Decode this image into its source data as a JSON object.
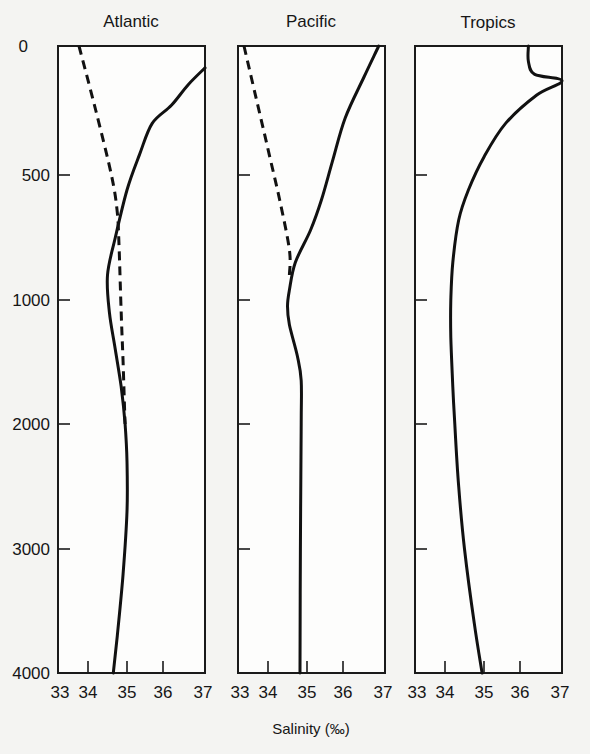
{
  "chart_data": {
    "type": "line",
    "title": "",
    "xlabel": "Salinity (‰)",
    "ylabel": "Depth (m)",
    "y_ticks": [
      0,
      500,
      1000,
      2000,
      3000,
      4000
    ],
    "x_ticks": [
      33,
      34,
      35,
      36,
      37
    ],
    "xlim": [
      33,
      37
    ],
    "ylim": [
      4000,
      0
    ],
    "y_axis_inverted": true,
    "legend": "solid = salinity profile; dashed = alternative/secondary profile (unlabeled)",
    "panels": [
      {
        "title": "Atlantic",
        "series": [
          {
            "name": "solid",
            "style": "solid",
            "points": [
              [
                37.0,
                85
              ],
              [
                36.6,
                150
              ],
              [
                36.2,
                230
              ],
              [
                35.7,
                300
              ],
              [
                35.35,
                420
              ],
              [
                35.0,
                560
              ],
              [
                34.7,
                750
              ],
              [
                34.5,
                900
              ],
              [
                34.55,
                1100
              ],
              [
                34.7,
                1400
              ],
              [
                34.85,
                1700
              ],
              [
                34.95,
                2000
              ],
              [
                35.0,
                2300
              ],
              [
                35.0,
                2700
              ],
              [
                34.9,
                3200
              ],
              [
                34.75,
                3700
              ],
              [
                34.65,
                4000
              ]
            ],
            "stroke_dashed": false
          },
          {
            "name": "dashed",
            "style": "dashed",
            "points": [
              [
                33.7,
                0
              ],
              [
                34.2,
                250
              ],
              [
                34.6,
                500
              ],
              [
                34.75,
                650
              ],
              [
                34.8,
                800
              ],
              [
                34.85,
                1100
              ],
              [
                34.9,
                1500
              ],
              [
                34.95,
                2000
              ]
            ],
            "stroke_dashed": true
          }
        ]
      },
      {
        "title": "Pacific",
        "series": [
          {
            "name": "solid",
            "style": "solid",
            "points": [
              [
                36.85,
                0
              ],
              [
                36.5,
                120
              ],
              [
                36.05,
                280
              ],
              [
                35.7,
                450
              ],
              [
                35.4,
                600
              ],
              [
                35.1,
                720
              ],
              [
                34.7,
                850
              ],
              [
                34.55,
                960
              ],
              [
                34.5,
                1050
              ],
              [
                34.55,
                1200
              ],
              [
                34.75,
                1450
              ],
              [
                34.85,
                1650
              ],
              [
                34.85,
                2000
              ],
              [
                34.83,
                3000
              ],
              [
                34.82,
                4000
              ]
            ],
            "stroke_dashed": false
          },
          {
            "name": "dashed",
            "style": "dashed",
            "points": [
              [
                33.2,
                0
              ],
              [
                33.6,
                200
              ],
              [
                34.0,
                400
              ],
              [
                34.3,
                600
              ],
              [
                34.55,
                800
              ],
              [
                34.55,
                900
              ]
            ],
            "stroke_dashed": true
          }
        ]
      },
      {
        "title": "Tropics",
        "series": [
          {
            "name": "solid",
            "style": "solid",
            "points": [
              [
                36.2,
                0
              ],
              [
                36.2,
                60
              ],
              [
                36.35,
                110
              ],
              [
                37.0,
                135
              ],
              [
                36.4,
                190
              ],
              [
                35.6,
                300
              ],
              [
                35.0,
                430
              ],
              [
                34.6,
                560
              ],
              [
                34.35,
                680
              ],
              [
                34.2,
                850
              ],
              [
                34.15,
                1000
              ],
              [
                34.15,
                1300
              ],
              [
                34.2,
                1700
              ],
              [
                34.25,
                2000
              ],
              [
                34.35,
                2500
              ],
              [
                34.5,
                3000
              ],
              [
                34.75,
                3600
              ],
              [
                34.95,
                4000
              ]
            ],
            "stroke_dashed": false
          }
        ]
      }
    ]
  },
  "figure": {
    "axis_label": "Salinity (‰)",
    "y_tick_labels": [
      "0",
      "500",
      "1000",
      "2000",
      "3000",
      "4000"
    ],
    "x_tick_labels": [
      "33",
      "34",
      "35",
      "36",
      "37"
    ],
    "panel_titles": [
      "Atlantic",
      "Pacific",
      "Tropics"
    ],
    "colors": {
      "line": "#111111",
      "frame": "#1a1a1a",
      "background": "#f4f4f2"
    }
  }
}
